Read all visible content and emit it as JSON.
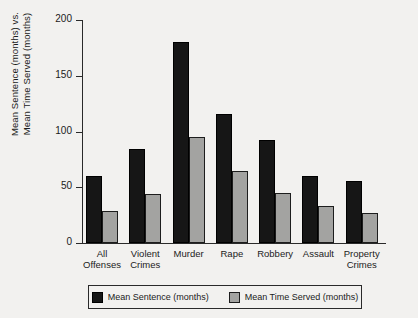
{
  "chart_data": {
    "type": "bar",
    "title": "",
    "xlabel": "",
    "ylabel": "Mean Sentence (months) vs.\nMean Time Served (months)",
    "categories": [
      "All\nOffenses",
      "Violent\nCrimes",
      "Murder",
      "Rape",
      "Robbery",
      "Assault",
      "Property\nCrimes"
    ],
    "series": [
      {
        "name": "Mean Sentence (months)",
        "color": "#161616",
        "values": [
          60,
          84,
          180,
          116,
          92,
          60,
          56
        ]
      },
      {
        "name": "Mean Time Served (months)",
        "color": "#a3a3a1",
        "values": [
          29,
          44,
          95,
          65,
          45,
          33,
          27
        ]
      }
    ],
    "ylim": [
      0,
      200
    ],
    "yticks": [
      0,
      50,
      100,
      150,
      200
    ],
    "ytick_labels": [
      "0",
      "50",
      "100",
      "150",
      "200"
    ],
    "grid": false,
    "legend_position": "bottom"
  },
  "legend": {
    "items": [
      {
        "label": "Mean Sentence (months)",
        "swatch": "black-swatch-icon"
      },
      {
        "label": "Mean Time Served (months)",
        "swatch": "gray-swatch-icon"
      }
    ]
  }
}
